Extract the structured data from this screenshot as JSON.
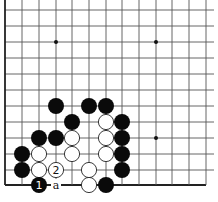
{
  "diagram": {
    "type": "go-board-corner",
    "grid": {
      "columns_x": [
        5,
        22,
        39,
        56,
        72,
        89,
        106,
        122,
        139,
        156,
        172,
        189,
        206
      ],
      "rows_y": [
        10,
        26,
        42,
        58,
        74,
        90,
        106,
        122,
        138,
        154,
        170,
        185
      ],
      "line_color": "#555555",
      "edge_color": "#222222"
    },
    "star_points": [
      {
        "col": 3,
        "row": 2
      },
      {
        "col": 9,
        "row": 2
      },
      {
        "col": 9,
        "row": 8
      }
    ],
    "stones": [
      {
        "color": "black",
        "col": 3,
        "row": 6
      },
      {
        "color": "black",
        "col": 5,
        "row": 6
      },
      {
        "color": "black",
        "col": 6,
        "row": 6
      },
      {
        "color": "black",
        "col": 4,
        "row": 7
      },
      {
        "color": "white",
        "col": 6,
        "row": 7
      },
      {
        "color": "black",
        "col": 7,
        "row": 7
      },
      {
        "color": "black",
        "col": 2,
        "row": 8
      },
      {
        "color": "black",
        "col": 3,
        "row": 8
      },
      {
        "color": "white",
        "col": 4,
        "row": 8
      },
      {
        "color": "white",
        "col": 6,
        "row": 8
      },
      {
        "color": "black",
        "col": 7,
        "row": 8
      },
      {
        "color": "black",
        "col": 1,
        "row": 9
      },
      {
        "color": "white",
        "col": 2,
        "row": 9
      },
      {
        "color": "white",
        "col": 4,
        "row": 9
      },
      {
        "color": "white",
        "col": 6,
        "row": 9
      },
      {
        "color": "black",
        "col": 7,
        "row": 9
      },
      {
        "color": "black",
        "col": 1,
        "row": 10
      },
      {
        "color": "white",
        "col": 2,
        "row": 10
      },
      {
        "color": "white",
        "col": 3,
        "row": 10,
        "label": "2"
      },
      {
        "color": "white",
        "col": 5,
        "row": 10
      },
      {
        "color": "black",
        "col": 7,
        "row": 10
      },
      {
        "color": "black",
        "col": 2,
        "row": 11,
        "label": "1"
      },
      {
        "color": "white",
        "col": 5,
        "row": 11
      },
      {
        "color": "black",
        "col": 6,
        "row": 11
      }
    ],
    "point_labels": [
      {
        "col": 3,
        "row": 11,
        "text": "a"
      }
    ]
  }
}
